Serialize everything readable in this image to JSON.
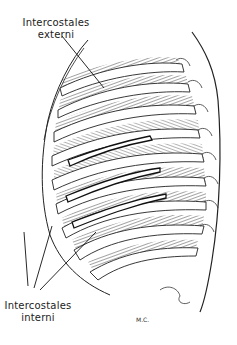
{
  "figure": {
    "labels": {
      "external": [
        "Intercostales",
        "externi"
      ],
      "internal": [
        "Intercostales",
        "interni"
      ]
    },
    "signature": "M.C."
  }
}
